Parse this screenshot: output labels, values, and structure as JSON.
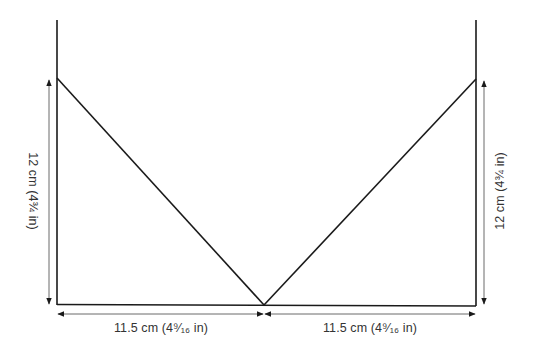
{
  "diagram": {
    "type": "pattern-schematic",
    "shape": "V-neck panel outline",
    "colors": {
      "outline": "#1a1a1a",
      "dimension_line": "#6a6a6a",
      "label_text": "#333333",
      "background": "#ffffff"
    },
    "dimensions": {
      "left_height": {
        "label": "12 cm (4¾ in)",
        "value_cm": 12,
        "value_in": "4¾",
        "orientation": "vertical",
        "side": "left"
      },
      "right_height": {
        "label": "12 cm (4¾ in)",
        "value_cm": 12,
        "value_in": "4¾",
        "orientation": "vertical",
        "side": "right"
      },
      "bottom_left_width": {
        "label": "11.5 cm (4⁹⁄₁₆ in)",
        "value_cm": 11.5,
        "value_in": "4 9/16",
        "orientation": "horizontal",
        "side": "bottom-left"
      },
      "bottom_right_width": {
        "label": "11.5 cm (4⁹⁄₁₆ in)",
        "value_cm": 11.5,
        "value_in": "4 9/16",
        "orientation": "horizontal",
        "side": "bottom-right"
      }
    }
  }
}
